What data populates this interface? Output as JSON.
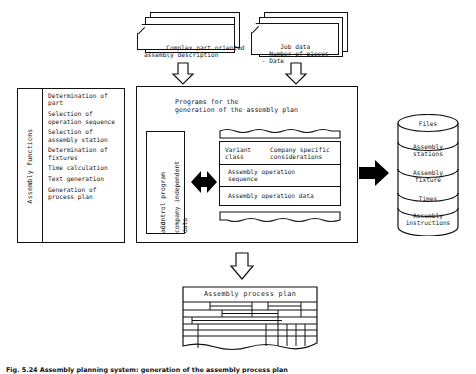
{
  "figure": {
    "caption": "Fig. 5.24 Assembly planning system: generation of the assembly process plan"
  },
  "inputs": [
    {
      "name": "complex-part-description",
      "lines": "Complex part oriented\nassembly description"
    },
    {
      "name": "job-data",
      "lines": "Job data\n - Number of pieces\n - Date"
    }
  ],
  "assembly_functions": {
    "side_label": "Assembly functions",
    "items": [
      "Determination of\npart",
      "Selection of\noperation sequence",
      "Selection of\nassembly station",
      "Determination of\nfixtures",
      "Time calculation",
      "Text generation",
      "Generation of\nprocess plan"
    ]
  },
  "main": {
    "title": "Programs for the\ngeneration of the assembly plan",
    "control_program": {
      "line1": "Control program",
      "line2": "and",
      "line3": "company independent",
      "line4": "data"
    },
    "variant_table": {
      "header_left": "Variant\nclass",
      "header_right": "Company specific\nconsiderations",
      "rows": [
        "Assembly operation\nsequence",
        "Assembly operation data"
      ]
    }
  },
  "database": {
    "name": "files-cylinder",
    "sections": [
      "Files",
      "Assembly\nstations",
      "Assembly\nfixture",
      "Times",
      "Assembly\ninstructions"
    ]
  },
  "output": {
    "title": "Assembly process plan"
  },
  "colors": {
    "line": "#111111",
    "fill": "#ffffff",
    "arrow_solid": "#000000"
  }
}
